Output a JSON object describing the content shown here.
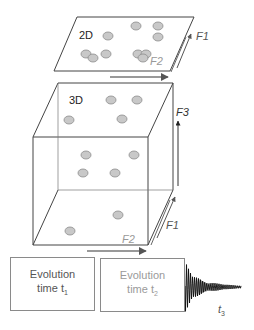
{
  "panel_2d": {
    "label": "2D",
    "axis_f1": "F1",
    "axis_f2": "F2",
    "peaks": [
      [
        136,
        26
      ],
      [
        158,
        26
      ],
      [
        108,
        36
      ],
      [
        158,
        37
      ],
      [
        86,
        54
      ],
      [
        93,
        58
      ],
      [
        106,
        54
      ],
      [
        138,
        54
      ],
      [
        146,
        54
      ],
      [
        143,
        58
      ]
    ]
  },
  "panel_3d": {
    "label": "3D",
    "axis_f1": "F1",
    "axis_f2": "F2",
    "axis_f3": "F3",
    "peaks": [
      [
        111,
        100
      ],
      [
        137,
        100
      ],
      [
        69,
        120
      ],
      [
        122,
        119
      ],
      [
        86,
        155
      ],
      [
        134,
        155
      ],
      [
        83,
        173
      ],
      [
        115,
        173
      ],
      [
        118,
        215
      ],
      [
        70,
        231
      ]
    ]
  },
  "pulse_sequence": {
    "box1_line1": "Evolution",
    "box1_line2": "time t",
    "box1_sub": "1",
    "box2_line1": "Evolution",
    "box2_line2": "time t",
    "box2_sub": "2",
    "acquisition_label": "t",
    "acquisition_sub": "3"
  },
  "colors": {
    "peak_fill": "#c8c8c8",
    "peak_stroke": "#8c8c8c",
    "line": "#333333",
    "arrow": "#777777"
  }
}
